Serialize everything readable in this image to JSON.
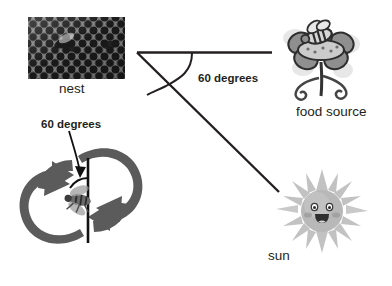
{
  "diagram": {
    "title_text": "",
    "background_color": "#ffffff",
    "ink_color": "#231f20",
    "labels": {
      "nest": "nest",
      "food_source": "food source",
      "sun": "sun",
      "angle_top": "60 degrees",
      "angle_dance": "60 degrees"
    },
    "icons": {
      "nest": "honeycomb-photo",
      "food_source": "flower-with-bee-illustration",
      "sun": "smiling-sun-illustration",
      "dance": "waggle-dance-figure-eight-arrows",
      "dance_center": "bee-illustration"
    },
    "geometry": {
      "vertex": "137,52",
      "horizontal_ray_end": "272,52",
      "diagonal_ray_end": "279,192",
      "angle_value": "60",
      "angle_unit": "degrees"
    },
    "colors": {
      "line": "#231f20",
      "arrow_gray": "#5b5b5b",
      "sun_body": "#b6b6b6",
      "sun_ray": "#cfcfcf",
      "flower_petal": "#8f8f8f",
      "flower_center": "#c9c9c9",
      "photo_base": "#8d8d8d"
    }
  }
}
